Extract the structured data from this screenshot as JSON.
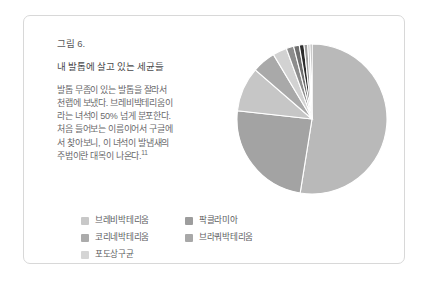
{
  "figure": {
    "caption": "그림 6.",
    "title": "내 발톱에 살고 있는 세균들",
    "body_lines": [
      "발톱 무좀이 있는 발톱을 잘라서",
      "천랩에 보냈다. 브레비박테리움이",
      "라는 녀석이 50% 넘게 분포한다.",
      "처음 들어보는 이름이어서 구글에",
      "서 찾아보니, 이 녀석이 발냄새의",
      "주범이란 대목이 나온다."
    ],
    "footnote_marker": "11"
  },
  "chart_data": {
    "type": "pie",
    "title": "내 발톱에 살고 있는 세균들",
    "legend_position": "bottom-left",
    "grid": false,
    "categories": [
      "브레비박테리움",
      "코리네박테리움",
      "포도상구균",
      "팍클라미아",
      "브라쿼박테리움"
    ],
    "values": [
      52,
      24,
      9.5,
      5,
      3
    ],
    "colors": [
      "#b9b9b9",
      "#a0a0a0",
      "#cfcfcf",
      "#8a8a8a",
      "#9a9a9a"
    ],
    "slices": [
      {
        "label": "브레비박테리움",
        "value": 52,
        "color": "#b9b9b9"
      },
      {
        "label": "코리네박테리움",
        "value": 24,
        "color": "#a3a3a3"
      },
      {
        "label": "포도상구균",
        "value": 9.5,
        "color": "#c6c6c6"
      },
      {
        "label": "팍클라미아",
        "value": 5,
        "color": "#a9a9a9"
      },
      {
        "label": "브라쿼박테리움",
        "value": 3,
        "color": "#d2d2d2"
      },
      {
        "label": "기타",
        "value": 1.6,
        "color": "#8d8d8d"
      },
      {
        "label": "기타",
        "value": 1.2,
        "color": "#6f6f6f"
      },
      {
        "label": "기타",
        "value": 1.0,
        "color": "#2b2b2b"
      },
      {
        "label": "기타",
        "value": 0.8,
        "color": "#9e9e9e"
      },
      {
        "label": "기타",
        "value": 0.5,
        "color": "#c0c0c0"
      },
      {
        "label": "기타",
        "value": 0.4,
        "color": "#8a8a8a"
      }
    ]
  },
  "legend": {
    "column_1": [
      {
        "label": "브레비박테리움",
        "color": "#c8c8c8"
      },
      {
        "label": "코리네박테리움",
        "color": "#ababab"
      },
      {
        "label": "포도상구균",
        "color": "#d5d5d5"
      }
    ],
    "column_2": [
      {
        "label": "팍클라미아",
        "color": "#9d9d9d"
      },
      {
        "label": "브라쿼박테리움",
        "color": "#a8a8a8"
      }
    ]
  }
}
